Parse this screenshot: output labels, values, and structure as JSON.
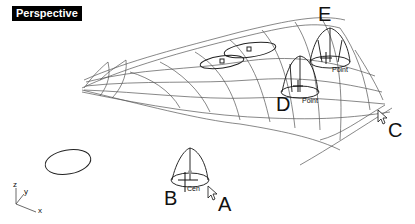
{
  "viewport": {
    "title": "Perspective"
  },
  "callouts": {
    "a": "A",
    "b": "B",
    "c": "C",
    "d": "D",
    "e": "E"
  },
  "osnap": {
    "point1": "Point",
    "point2": "Point",
    "cen": "Cen"
  },
  "axes": {
    "x": "x",
    "y": "y",
    "z": "z"
  }
}
